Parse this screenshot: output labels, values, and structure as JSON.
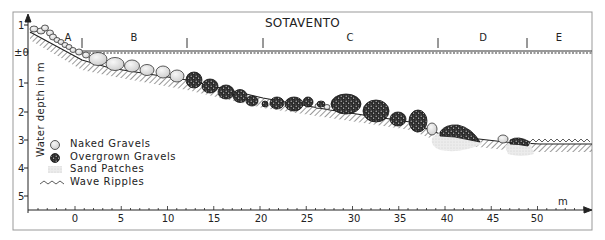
{
  "figure": {
    "title": "SOTAVENTO",
    "y_axis": {
      "label": "Water depth in m",
      "ticks": [
        "1",
        "±0",
        "1",
        "2",
        "3",
        "4",
        "5"
      ]
    },
    "x_axis": {
      "unit": "m",
      "ticks": [
        "0",
        "5",
        "10",
        "15",
        "20",
        "25",
        "30",
        "35",
        "40",
        "45",
        "50"
      ]
    },
    "zones": [
      {
        "label": "A"
      },
      {
        "label": "B"
      },
      {
        "label": "C"
      },
      {
        "label": "D"
      },
      {
        "label": "E"
      }
    ],
    "legend": [
      {
        "icon": "naked-gravel-icon",
        "label": "Naked Gravels"
      },
      {
        "icon": "overgrown-gravel-icon",
        "label": "Overgrown Gravels"
      },
      {
        "icon": "sand-patch-icon",
        "label": "Sand Patches"
      },
      {
        "icon": "wave-ripple-icon",
        "label": "Wave Ripples"
      }
    ],
    "colors": {
      "line": "#222222",
      "naked_gravel": "#e6e6e6",
      "overgrown_gravel": "#2a2a2a",
      "sand": "#e4e4e4",
      "hatch": "#555555"
    }
  }
}
